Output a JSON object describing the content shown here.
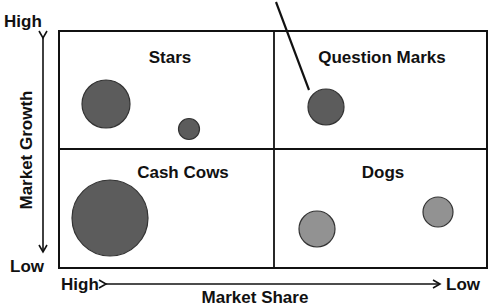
{
  "diagram": {
    "type": "bcg-matrix",
    "y_axis": {
      "label": "Market Growth",
      "high": "High",
      "low": "Low"
    },
    "x_axis": {
      "label": "Market Share",
      "high": "High",
      "low": "Low"
    },
    "quadrants": [
      {
        "id": "stars",
        "label": "Stars"
      },
      {
        "id": "question-marks",
        "label": "Question Marks"
      },
      {
        "id": "cash-cows",
        "label": "Cash Cows"
      },
      {
        "id": "dogs",
        "label": "Dogs"
      }
    ],
    "colors": {
      "dark_bubble": "#5c5c5c",
      "light_bubble": "#929292",
      "line": "#111111",
      "background": "#ffffff"
    }
  }
}
